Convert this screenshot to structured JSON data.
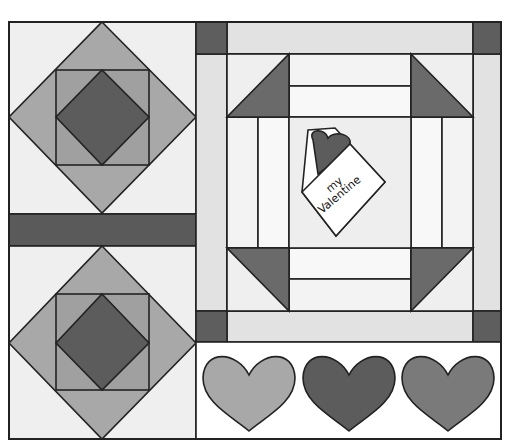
{
  "quilt": {
    "title_card_text": [
      "my",
      "Valentine"
    ],
    "colors": {
      "background": "#ffffff",
      "light": "#eeeeee",
      "strip": "#e2e2e2",
      "medium": "#a8a8a8",
      "mid_dark": "#808080",
      "dark": "#5c5c5c",
      "outline": "#222222"
    },
    "blocks": [
      {
        "name": "square-in-square-top"
      },
      {
        "name": "square-in-square-bottom"
      },
      {
        "name": "sashing-bar"
      },
      {
        "name": "framed-center-block"
      },
      {
        "name": "hearts-row"
      }
    ],
    "hearts": [
      {
        "name": "heart-light",
        "color": "#a8a8a8"
      },
      {
        "name": "heart-dark",
        "color": "#5c5c5c"
      },
      {
        "name": "heart-medium",
        "color": "#7a7a7a"
      }
    ]
  }
}
